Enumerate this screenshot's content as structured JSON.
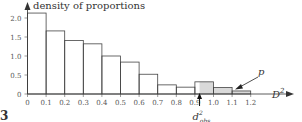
{
  "chart_data": {
    "type": "bar",
    "title": "",
    "ylabel": "density of proportions",
    "xlabel": "D²",
    "bin_edges": [
      0,
      0.1,
      0.2,
      0.3,
      0.4,
      0.5,
      0.6,
      0.7,
      0.8,
      0.9,
      1.0,
      1.1,
      1.2
    ],
    "categories": [
      "0-0.1",
      "0.1-0.2",
      "0.2-0.3",
      "0.3-0.4",
      "0.4-0.5",
      "0.5-0.6",
      "0.6-0.7",
      "0.7-0.8",
      "0.8-0.9",
      "0.9-1.0",
      "1.0-1.1",
      "1.1-1.2"
    ],
    "values": [
      2.13,
      1.66,
      1.41,
      1.32,
      1.0,
      0.84,
      0.52,
      0.24,
      0.18,
      0.32,
      0.17,
      0.08
    ],
    "x_ticks": [
      "0",
      "0.1",
      "0.2",
      "0.3",
      "0.4",
      "0.5",
      "0.6",
      "0.7",
      "0.8",
      "0.9",
      "1.0",
      "1.1",
      "1.2"
    ],
    "y_ticks": [
      "0",
      "0.5",
      "1.0",
      "1.5",
      "2.0"
    ],
    "ylim": [
      0,
      2.2
    ],
    "xlim": [
      0,
      1.2
    ],
    "grid": false,
    "legend": null,
    "annotations": [
      {
        "text": "d²_obs",
        "x": 0.925,
        "description": "observed value marked with upward arrow on x-axis"
      },
      {
        "text": "p",
        "description": "shaded tail area to the right of d²_obs (p-value)"
      }
    ],
    "shaded_region": {
      "from": 0.925,
      "to": 1.2,
      "color": "#d9d9d9"
    }
  },
  "labels": {
    "ylabel": "density of proportions",
    "xlabel_base": "D",
    "xlabel_sup": "2",
    "dobs_base": "d",
    "dobs_sup": "2",
    "dobs_sub": "obs",
    "p": "p",
    "caption_fragment": "3"
  }
}
